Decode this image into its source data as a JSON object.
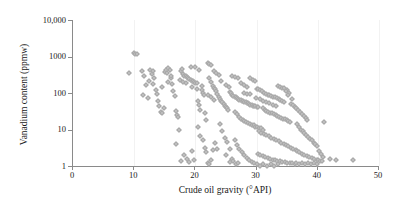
{
  "chart_data": {
    "type": "scatter",
    "title": "",
    "xlabel": "Crude oil gravity (°API)",
    "ylabel": "Vanadium content (ppmw)",
    "xlim": [
      0,
      50
    ],
    "ylim": [
      1,
      10000
    ],
    "yscale": "log",
    "xscale": "linear",
    "grid": "vertical-faint",
    "legend": "none",
    "marker": {
      "shape": "diamond",
      "color": "#c0c0c0",
      "edge_color": "#a6a6a6",
      "size_px": 4
    },
    "axis_color": "#8a8a8a",
    "xticks": [
      0,
      10,
      20,
      30,
      40,
      50
    ],
    "xtick_labels": [
      "0",
      "10",
      "20",
      "30",
      "40",
      "50"
    ],
    "yticks": [
      1,
      10,
      100,
      1000,
      10000
    ],
    "ytick_labels": [
      "1",
      "10",
      "100",
      "1000",
      "10,000"
    ],
    "series": [
      {
        "name": "Crude oil samples",
        "points": [
          [
            9.2,
            350
          ],
          [
            10.0,
            1250
          ],
          [
            10.2,
            1150
          ],
          [
            10.4,
            1200
          ],
          [
            11.3,
            400
          ],
          [
            11.6,
            300
          ],
          [
            11.9,
            170
          ],
          [
            12.2,
            75
          ],
          [
            12.6,
            430
          ],
          [
            12.9,
            330
          ],
          [
            13.1,
            390
          ],
          [
            13.3,
            260
          ],
          [
            13.5,
            120
          ],
          [
            13.7,
            95
          ],
          [
            13.9,
            60
          ],
          [
            14.1,
            45
          ],
          [
            14.3,
            30
          ],
          [
            14.5,
            28
          ],
          [
            14.8,
            40
          ],
          [
            15.0,
            380
          ],
          [
            15.2,
            420
          ],
          [
            15.4,
            350
          ],
          [
            15.6,
            470
          ],
          [
            15.8,
            440
          ],
          [
            16.0,
            250
          ],
          [
            16.2,
            180
          ],
          [
            16.4,
            110
          ],
          [
            16.6,
            85
          ],
          [
            16.8,
            32
          ],
          [
            17.0,
            25
          ],
          [
            17.2,
            22
          ],
          [
            17.4,
            10
          ],
          [
            17.6,
            400
          ],
          [
            17.8,
            450
          ],
          [
            18.0,
            330
          ],
          [
            18.2,
            300
          ],
          [
            18.4,
            290
          ],
          [
            18.6,
            270
          ],
          [
            18.8,
            250
          ],
          [
            19.0,
            240
          ],
          [
            19.2,
            230
          ],
          [
            19.4,
            220
          ],
          [
            19.6,
            215
          ],
          [
            19.8,
            200
          ],
          [
            16.9,
            4.0
          ],
          [
            17.6,
            1.4
          ],
          [
            18.2,
            2.0
          ],
          [
            18.6,
            1.6
          ],
          [
            19.0,
            1.3
          ],
          [
            19.4,
            2.6
          ],
          [
            19.8,
            1.5
          ],
          [
            20.0,
            190
          ],
          [
            20.2,
            185
          ],
          [
            20.4,
            60
          ],
          [
            20.6,
            48
          ],
          [
            20.8,
            35
          ],
          [
            21.0,
            120
          ],
          [
            21.2,
            100
          ],
          [
            21.4,
            90
          ],
          [
            21.6,
            28
          ],
          [
            21.8,
            18
          ],
          [
            22.0,
            650
          ],
          [
            22.3,
            640
          ],
          [
            22.6,
            600
          ],
          [
            20.4,
            12
          ],
          [
            20.8,
            6.5
          ],
          [
            21.2,
            5.0
          ],
          [
            21.5,
            3.2
          ],
          [
            21.8,
            2.4
          ],
          [
            22.0,
            1.2
          ],
          [
            22.3,
            1.1
          ],
          [
            22.6,
            1.5
          ],
          [
            22.9,
            2.8
          ],
          [
            23.2,
            4.2
          ],
          [
            23.5,
            3.0
          ],
          [
            22.2,
            250
          ],
          [
            22.5,
            200
          ],
          [
            22.8,
            160
          ],
          [
            23.0,
            140
          ],
          [
            23.2,
            130
          ],
          [
            23.4,
            115
          ],
          [
            23.6,
            95
          ],
          [
            23.8,
            80
          ],
          [
            24.0,
            70
          ],
          [
            24.2,
            62
          ],
          [
            24.4,
            55
          ],
          [
            24.6,
            50
          ],
          [
            24.8,
            45
          ],
          [
            25.0,
            42
          ],
          [
            25.2,
            38
          ],
          [
            25.4,
            34
          ],
          [
            24.0,
            14
          ],
          [
            24.4,
            9.0
          ],
          [
            24.8,
            6.0
          ],
          [
            25.2,
            4.5
          ],
          [
            25.6,
            3.0
          ],
          [
            25.0,
            2.0
          ],
          [
            25.6,
            1.3
          ],
          [
            26.0,
            1.6
          ],
          [
            25.6,
            105
          ],
          [
            25.8,
            98
          ],
          [
            26.0,
            90
          ],
          [
            26.2,
            85
          ],
          [
            26.4,
            80
          ],
          [
            26.6,
            76
          ],
          [
            26.8,
            72
          ],
          [
            27.0,
            68
          ],
          [
            27.2,
            66
          ],
          [
            27.4,
            64
          ],
          [
            27.6,
            62
          ],
          [
            27.8,
            60
          ],
          [
            28.0,
            58
          ],
          [
            28.2,
            56
          ],
          [
            28.4,
            54
          ],
          [
            28.6,
            52
          ],
          [
            28.8,
            50
          ],
          [
            29.0,
            48
          ],
          [
            29.2,
            46
          ],
          [
            29.4,
            45
          ],
          [
            29.6,
            44
          ],
          [
            29.8,
            43
          ],
          [
            30.0,
            42
          ],
          [
            30.2,
            41
          ],
          [
            26.5,
            30
          ],
          [
            26.8,
            26
          ],
          [
            27.1,
            22
          ],
          [
            27.4,
            20
          ],
          [
            27.7,
            18
          ],
          [
            28.0,
            17
          ],
          [
            28.3,
            16
          ],
          [
            28.6,
            15
          ],
          [
            28.9,
            14
          ],
          [
            29.2,
            13
          ],
          [
            29.5,
            13
          ],
          [
            29.8,
            12
          ],
          [
            30.1,
            12
          ],
          [
            30.4,
            11
          ],
          [
            30.7,
            11
          ],
          [
            31.0,
            10
          ],
          [
            26.4,
            5.0
          ],
          [
            26.8,
            3.8
          ],
          [
            27.2,
            3.0
          ],
          [
            27.6,
            2.4
          ],
          [
            28.0,
            2.0
          ],
          [
            28.4,
            1.7
          ],
          [
            28.8,
            1.5
          ],
          [
            29.2,
            1.3
          ],
          [
            29.6,
            1.2
          ],
          [
            26.2,
            1.4
          ],
          [
            26.6,
            1.1
          ],
          [
            27.0,
            1.2
          ],
          [
            30.0,
            130
          ],
          [
            30.3,
            125
          ],
          [
            30.6,
            118
          ],
          [
            30.9,
            110
          ],
          [
            31.2,
            100
          ],
          [
            31.5,
            95
          ],
          [
            31.8,
            90
          ],
          [
            32.1,
            88
          ],
          [
            32.4,
            85
          ],
          [
            32.7,
            80
          ],
          [
            33.0,
            78
          ],
          [
            33.3,
            75
          ],
          [
            33.6,
            70
          ],
          [
            33.9,
            66
          ],
          [
            34.2,
            60
          ],
          [
            34.5,
            56
          ],
          [
            31.0,
            38
          ],
          [
            31.3,
            35
          ],
          [
            31.6,
            33
          ],
          [
            31.9,
            31
          ],
          [
            32.2,
            29
          ],
          [
            32.5,
            28
          ],
          [
            32.8,
            26
          ],
          [
            33.1,
            25
          ],
          [
            33.4,
            24
          ],
          [
            33.7,
            22
          ],
          [
            34.0,
            21
          ],
          [
            34.3,
            20
          ],
          [
            34.6,
            19
          ],
          [
            34.9,
            18
          ],
          [
            35.2,
            17
          ],
          [
            35.5,
            16
          ],
          [
            30.4,
            9.0
          ],
          [
            30.8,
            8.0
          ],
          [
            31.2,
            7.5
          ],
          [
            31.6,
            7.0
          ],
          [
            32.0,
            6.5
          ],
          [
            32.4,
            6.0
          ],
          [
            32.8,
            5.6
          ],
          [
            33.2,
            5.2
          ],
          [
            33.6,
            4.8
          ],
          [
            34.0,
            4.4
          ],
          [
            34.4,
            4.0
          ],
          [
            34.8,
            3.8
          ],
          [
            35.2,
            3.5
          ],
          [
            35.6,
            3.2
          ],
          [
            36.0,
            3.0
          ],
          [
            36.4,
            2.8
          ],
          [
            30.2,
            2.2
          ],
          [
            30.6,
            2.0
          ],
          [
            31.0,
            1.9
          ],
          [
            31.4,
            1.8
          ],
          [
            31.8,
            1.7
          ],
          [
            32.2,
            1.6
          ],
          [
            32.6,
            1.5
          ],
          [
            33.0,
            1.5
          ],
          [
            33.4,
            1.4
          ],
          [
            33.8,
            1.4
          ],
          [
            34.2,
            1.3
          ],
          [
            34.6,
            1.3
          ],
          [
            35.0,
            1.2
          ],
          [
            35.4,
            1.2
          ],
          [
            35.8,
            1.2
          ],
          [
            36.2,
            1.1
          ],
          [
            30.0,
            1.1
          ],
          [
            30.5,
            1.0
          ],
          [
            31.1,
            1.1
          ],
          [
            31.7,
            1.0
          ],
          [
            32.3,
            1.1
          ],
          [
            32.9,
            1.0
          ],
          [
            33.5,
            1.1
          ],
          [
            33.5,
            160
          ],
          [
            33.8,
            150
          ],
          [
            34.1,
            140
          ],
          [
            34.4,
            135
          ],
          [
            35.0,
            120
          ],
          [
            35.3,
            100
          ],
          [
            35.6,
            50
          ],
          [
            35.9,
            46
          ],
          [
            36.2,
            42
          ],
          [
            36.5,
            38
          ],
          [
            36.8,
            34
          ],
          [
            37.1,
            30
          ],
          [
            37.4,
            27
          ],
          [
            37.7,
            24
          ],
          [
            38.0,
            21
          ],
          [
            38.3,
            18
          ],
          [
            36.6,
            14
          ],
          [
            36.9,
            12
          ],
          [
            37.2,
            10
          ],
          [
            37.5,
            9.0
          ],
          [
            37.8,
            8.0
          ],
          [
            38.1,
            7.0
          ],
          [
            38.4,
            6.2
          ],
          [
            38.7,
            5.5
          ],
          [
            39.0,
            5.0
          ],
          [
            39.3,
            4.4
          ],
          [
            39.6,
            4.0
          ],
          [
            39.9,
            3.6
          ],
          [
            36.6,
            2.6
          ],
          [
            37.0,
            2.4
          ],
          [
            37.4,
            2.2
          ],
          [
            37.8,
            2.0
          ],
          [
            38.2,
            1.9
          ],
          [
            38.6,
            1.8
          ],
          [
            39.0,
            1.7
          ],
          [
            39.4,
            1.6
          ],
          [
            39.8,
            1.5
          ],
          [
            40.1,
            1.5
          ],
          [
            40.4,
            1.4
          ],
          [
            40.7,
            1.4
          ],
          [
            36.4,
            1.2
          ],
          [
            36.9,
            1.1
          ],
          [
            37.4,
            1.2
          ],
          [
            37.9,
            1.1
          ],
          [
            38.4,
            1.2
          ],
          [
            38.9,
            1.1
          ],
          [
            39.4,
            1.2
          ],
          [
            39.9,
            1.1
          ],
          [
            40.2,
            2.6
          ],
          [
            40.5,
            2.2
          ],
          [
            40.8,
            1.8
          ],
          [
            41.0,
            16
          ],
          [
            35.2,
            90
          ],
          [
            35.8,
            70
          ],
          [
            34.8,
            110
          ],
          [
            29.0,
            260
          ],
          [
            29.4,
            230
          ],
          [
            29.8,
            210
          ],
          [
            28.5,
            150
          ],
          [
            28.0,
            170
          ],
          [
            27.5,
            190
          ],
          [
            26.0,
            300
          ],
          [
            26.4,
            280
          ],
          [
            27.0,
            250
          ],
          [
            23.0,
            400
          ],
          [
            23.4,
            360
          ],
          [
            23.8,
            320
          ],
          [
            20.0,
            500
          ],
          [
            20.6,
            430
          ],
          [
            19.2,
            520
          ],
          [
            43.0,
            1.5
          ],
          [
            45.8,
            1.5
          ],
          [
            42.0,
            1.6
          ],
          [
            31.5,
            55
          ],
          [
            32.0,
            52
          ],
          [
            32.6,
            48
          ],
          [
            33.2,
            45
          ],
          [
            29.9,
            75
          ],
          [
            30.5,
            68
          ],
          [
            31.1,
            62
          ],
          [
            27.9,
            100
          ],
          [
            28.4,
            96
          ],
          [
            28.9,
            92
          ],
          [
            25.0,
            170
          ],
          [
            25.5,
            150
          ],
          [
            24.2,
            210
          ],
          [
            22.0,
            90
          ],
          [
            22.6,
            78
          ],
          [
            23.0,
            66
          ],
          [
            19.5,
            150
          ],
          [
            20.2,
            130
          ],
          [
            21.0,
            155
          ],
          [
            18.0,
            200
          ],
          [
            18.5,
            185
          ],
          [
            17.5,
            230
          ],
          [
            15.5,
            200
          ],
          [
            16.0,
            300
          ],
          [
            14.6,
            150
          ],
          [
            13.0,
            180
          ],
          [
            12.4,
            220
          ],
          [
            11.5,
            90
          ]
        ]
      }
    ]
  }
}
